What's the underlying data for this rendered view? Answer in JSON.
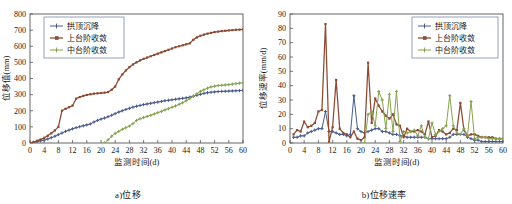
{
  "figure": {
    "panels": [
      {
        "id": "displacement",
        "caption": "a)位移",
        "xlabel": "监测时间(d)",
        "ylabel": "位移值(mm)"
      },
      {
        "id": "displacement-rate",
        "caption": "b)位移速率",
        "xlabel": "监测时间(d)",
        "ylabel": "位移速率(mm/d)"
      }
    ]
  },
  "colors": {
    "series_crown": "#4a5b8c",
    "series_upper": "#8b4a32",
    "series_middle": "#86a24e",
    "axis": "#555555",
    "legend_border": "#7b8aa8",
    "text": "#1a1a1a"
  },
  "chart_data": [
    {
      "type": "line",
      "id": "displacement",
      "title": "a)位移",
      "xlabel": "监测时间(d)",
      "ylabel": "位移值(mm)",
      "xlim": [
        0,
        60
      ],
      "ylim": [
        0,
        800
      ],
      "xticks": [
        0,
        4,
        8,
        12,
        16,
        20,
        24,
        28,
        32,
        36,
        40,
        44,
        48,
        52,
        56,
        60
      ],
      "yticks": [
        0,
        100,
        200,
        300,
        400,
        500,
        600,
        700,
        800
      ],
      "grid": false,
      "legend_position": "upper-left",
      "series": [
        {
          "name": "拱顶沉降",
          "color": "#4a5b8c",
          "marker": "plus",
          "x": [
            0,
            1,
            2,
            3,
            4,
            5,
            6,
            7,
            8,
            9,
            10,
            11,
            12,
            13,
            14,
            15,
            16,
            17,
            18,
            19,
            20,
            21,
            22,
            23,
            24,
            25,
            26,
            27,
            28,
            29,
            30,
            31,
            32,
            33,
            34,
            35,
            36,
            37,
            38,
            39,
            40,
            41,
            42,
            43,
            44,
            45,
            46,
            47,
            48,
            49,
            50,
            51,
            52,
            53,
            54,
            55,
            56,
            57,
            58,
            59,
            60
          ],
          "y": [
            0,
            4,
            8,
            13,
            18,
            25,
            33,
            42,
            52,
            62,
            72,
            80,
            88,
            95,
            101,
            107,
            112,
            118,
            130,
            140,
            148,
            155,
            163,
            172,
            182,
            192,
            200,
            208,
            215,
            222,
            228,
            233,
            238,
            242,
            246,
            250,
            254,
            258,
            262,
            265,
            268,
            271,
            274,
            277,
            280,
            284,
            290,
            296,
            302,
            308,
            312,
            315,
            317,
            319,
            320,
            321,
            322,
            323,
            324,
            325,
            326
          ]
        },
        {
          "name": "上台阶收敛",
          "color": "#8b4a32",
          "marker": "square",
          "x": [
            0,
            1,
            2,
            3,
            4,
            5,
            6,
            7,
            8,
            9,
            10,
            11,
            12,
            13,
            14,
            15,
            16,
            17,
            18,
            19,
            20,
            21,
            22,
            23,
            24,
            25,
            26,
            27,
            28,
            29,
            30,
            31,
            32,
            33,
            34,
            35,
            36,
            37,
            38,
            39,
            40,
            41,
            42,
            43,
            44,
            45,
            46,
            47,
            48,
            49,
            50,
            51,
            52,
            53,
            54,
            55,
            56,
            57,
            58,
            59,
            60
          ],
          "y": [
            0,
            6,
            14,
            22,
            32,
            45,
            60,
            78,
            100,
            200,
            212,
            222,
            232,
            275,
            285,
            292,
            298,
            302,
            306,
            308,
            310,
            312,
            316,
            330,
            350,
            395,
            425,
            450,
            470,
            487,
            500,
            512,
            522,
            530,
            538,
            546,
            554,
            562,
            570,
            578,
            586,
            594,
            600,
            606,
            612,
            618,
            640,
            655,
            665,
            672,
            678,
            683,
            688,
            691,
            694,
            696,
            698,
            700,
            702,
            703,
            704
          ]
        },
        {
          "name": "中台阶收敛",
          "color": "#86a24e",
          "marker": "plus",
          "x": [
            21,
            22,
            23,
            24,
            25,
            26,
            27,
            28,
            29,
            30,
            31,
            32,
            33,
            34,
            35,
            36,
            37,
            38,
            39,
            40,
            41,
            42,
            43,
            44,
            45,
            46,
            47,
            48,
            49,
            50,
            51,
            52,
            53,
            54,
            55,
            56,
            57,
            58,
            59,
            60
          ],
          "y": [
            0,
            20,
            42,
            60,
            72,
            85,
            95,
            105,
            120,
            140,
            150,
            158,
            165,
            172,
            180,
            188,
            196,
            205,
            213,
            222,
            230,
            240,
            250,
            262,
            275,
            290,
            305,
            320,
            330,
            340,
            348,
            352,
            356,
            358,
            360,
            362,
            365,
            368,
            371,
            374
          ]
        }
      ]
    },
    {
      "type": "line",
      "id": "displacement-rate",
      "title": "b)位移速率",
      "xlabel": "监测时间(d)",
      "ylabel": "位移速率(mm/d)",
      "xlim": [
        0,
        60
      ],
      "ylim": [
        0,
        90
      ],
      "xticks": [
        0,
        4,
        8,
        12,
        16,
        20,
        24,
        28,
        32,
        36,
        40,
        44,
        48,
        52,
        56,
        60
      ],
      "yticks": [
        0,
        10,
        20,
        30,
        40,
        50,
        60,
        70,
        80,
        90
      ],
      "grid": false,
      "legend_position": "upper-right",
      "series": [
        {
          "name": "拱顶沉降",
          "color": "#4a5b8c",
          "marker": "plus",
          "x": [
            1,
            2,
            3,
            4,
            5,
            6,
            7,
            8,
            9,
            10,
            11,
            12,
            13,
            14,
            15,
            16,
            17,
            18,
            19,
            20,
            21,
            22,
            23,
            24,
            25,
            26,
            27,
            28,
            29,
            30,
            31,
            32,
            33,
            34,
            35,
            36,
            37,
            38,
            39,
            40,
            41,
            42,
            43,
            44,
            45,
            46,
            47,
            48,
            49,
            50,
            51,
            52,
            53,
            54,
            55,
            56,
            57,
            58,
            59,
            60
          ],
          "y": [
            4,
            4,
            5,
            5,
            7,
            8,
            9,
            10,
            10,
            22,
            8,
            8,
            7,
            6,
            6,
            5,
            6,
            33,
            10,
            8,
            7,
            8,
            9,
            10,
            10,
            8,
            8,
            7,
            6,
            6,
            5,
            5,
            4,
            4,
            4,
            4,
            4,
            4,
            3,
            3,
            3,
            3,
            3,
            3,
            4,
            6,
            6,
            6,
            6,
            4,
            3,
            2,
            2,
            1,
            1,
            1,
            1,
            1,
            1,
            1
          ]
        },
        {
          "name": "上台阶收敛",
          "color": "#8b4a32",
          "marker": "square",
          "x": [
            1,
            2,
            3,
            4,
            5,
            6,
            7,
            8,
            9,
            10,
            11,
            12,
            13,
            14,
            15,
            16,
            17,
            18,
            19,
            20,
            21,
            22,
            23,
            24,
            25,
            26,
            27,
            28,
            29,
            30,
            31,
            32,
            33,
            34,
            35,
            36,
            37,
            38,
            39,
            40,
            41,
            42,
            43,
            44,
            45,
            46,
            47,
            48,
            49,
            50,
            51,
            52,
            53,
            54,
            55,
            56,
            57,
            58,
            59,
            60
          ],
          "y": [
            6,
            9,
            8,
            15,
            11,
            12,
            14,
            22,
            23,
            83,
            1,
            11,
            44,
            10,
            7,
            6,
            4,
            8,
            3,
            2,
            4,
            56,
            14,
            31,
            26,
            22,
            19,
            17,
            20,
            13,
            12,
            4,
            10,
            8,
            8,
            9,
            8,
            6,
            15,
            4,
            5,
            9,
            8,
            6,
            7,
            10,
            9,
            28,
            9,
            5,
            6,
            6,
            5,
            4,
            4,
            4,
            4,
            3,
            3,
            3
          ]
        },
        {
          "name": "中台阶收敛",
          "color": "#86a24e",
          "marker": "plus",
          "x": [
            21,
            22,
            23,
            24,
            25,
            26,
            27,
            28,
            29,
            30,
            31,
            32,
            33,
            34,
            35,
            36,
            37,
            38,
            39,
            40,
            41,
            42,
            43,
            44,
            45,
            46,
            47,
            48,
            49,
            50,
            51,
            52,
            53,
            54,
            55,
            56,
            57,
            58,
            59,
            60
          ],
          "y": [
            0,
            20,
            22,
            12,
            36,
            30,
            10,
            34,
            8,
            36,
            1,
            8,
            7,
            8,
            9,
            5,
            12,
            4,
            3,
            14,
            6,
            8,
            10,
            12,
            33,
            12,
            7,
            6,
            10,
            5,
            29,
            3,
            4,
            4,
            4,
            3,
            3,
            3,
            3,
            3
          ]
        }
      ]
    }
  ]
}
